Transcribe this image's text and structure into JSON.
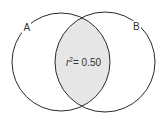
{
  "diagram": {
    "type": "venn",
    "sets": [
      {
        "label": "A",
        "cx": 61,
        "cy": 62,
        "r": 49
      },
      {
        "label": "B",
        "cx": 105,
        "cy": 62,
        "r": 50
      }
    ],
    "overlap": {
      "label_base": "r",
      "label_sup": "2",
      "label_rest": "= 0.50",
      "fill": "#e6e6e6"
    },
    "stroke": "#2a2a2a"
  }
}
